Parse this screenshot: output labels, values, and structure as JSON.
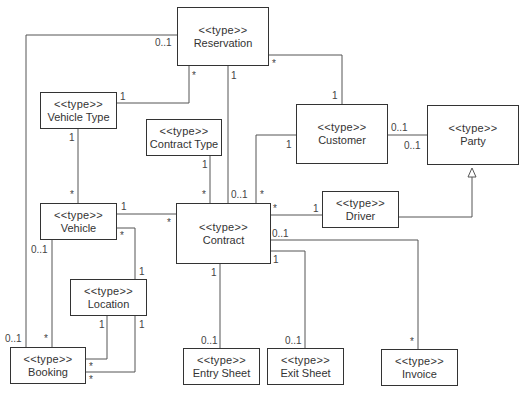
{
  "diagram": {
    "type": "uml-class-diagram",
    "stereotype": "<<type>>",
    "classes": [
      {
        "id": "reservation",
        "name": "Reservation"
      },
      {
        "id": "vehicle_type",
        "name": "Vehicle Type"
      },
      {
        "id": "contract_type",
        "name": "Contract Type"
      },
      {
        "id": "customer",
        "name": "Customer"
      },
      {
        "id": "party",
        "name": "Party"
      },
      {
        "id": "vehicle",
        "name": "Vehicle"
      },
      {
        "id": "contract",
        "name": "Contract"
      },
      {
        "id": "driver",
        "name": "Driver"
      },
      {
        "id": "location",
        "name": "Location"
      },
      {
        "id": "booking",
        "name": "Booking"
      },
      {
        "id": "entry_sheet",
        "name": "Entry Sheet"
      },
      {
        "id": "exit_sheet",
        "name": "Exit Sheet"
      },
      {
        "id": "invoice",
        "name": "Invoice"
      }
    ],
    "associations": [
      {
        "from": "Reservation",
        "to": "Vehicle Type",
        "from_mult": "*",
        "to_mult": "1"
      },
      {
        "from": "Reservation",
        "to": "Booking",
        "from_mult": "0..1",
        "to_mult": "0..1"
      },
      {
        "from": "Reservation",
        "to": "Contract",
        "from_mult": "1",
        "to_mult": "0..1"
      },
      {
        "from": "Reservation",
        "to": "Customer",
        "from_mult": "*",
        "to_mult": "1"
      },
      {
        "from": "Vehicle Type",
        "to": "Vehicle",
        "from_mult": "1",
        "to_mult": "*"
      },
      {
        "from": "Contract Type",
        "to": "Contract",
        "from_mult": "1",
        "to_mult": "*"
      },
      {
        "from": "Customer",
        "to": "Contract",
        "from_mult": "1",
        "to_mult": "*"
      },
      {
        "from": "Customer",
        "to": "Party",
        "from_mult": "0..1",
        "to_mult": "0..1"
      },
      {
        "from": "Vehicle",
        "to": "Contract",
        "from_mult": "1",
        "to_mult": "*"
      },
      {
        "from": "Vehicle",
        "to": "Location",
        "from_mult": "*",
        "to_mult": "1"
      },
      {
        "from": "Vehicle",
        "to": "Booking",
        "from_mult": "0..1",
        "to_mult": "*"
      },
      {
        "from": "Location",
        "to": "Booking",
        "from_mult": "1",
        "to_mult": "*"
      },
      {
        "from": "Location",
        "to": "Booking",
        "from_mult": "1",
        "to_mult": "*"
      },
      {
        "from": "Contract",
        "to": "Driver",
        "from_mult": "*",
        "to_mult": "1"
      },
      {
        "from": "Contract",
        "to": "Invoice",
        "from_mult": "0..1",
        "to_mult": "*"
      },
      {
        "from": "Contract",
        "to": "Exit Sheet",
        "from_mult": "1",
        "to_mult": "0..1"
      },
      {
        "from": "Contract",
        "to": "Entry Sheet",
        "from_mult": "1",
        "to_mult": "0..1"
      }
    ],
    "generalizations": [
      {
        "child": "Driver",
        "parent": "Party"
      }
    ],
    "labels": {
      "res_booking_res": "0..1",
      "res_vt_res": "*",
      "res_vt_vt": "1",
      "res_contract_res": "1",
      "res_contract_con": "0..1",
      "res_cust_res": "*",
      "res_cust_cust": "1",
      "vt_vehicle_vt": "1",
      "vt_vehicle_veh": "*",
      "ct_contract_ct": "1",
      "ct_contract_con": "*",
      "cust_contract_cust": "1",
      "cust_contract_con": "*",
      "cust_party_cust": "0..1",
      "cust_party_party": "0..1",
      "veh_contract_veh": "1",
      "veh_contract_con": "*",
      "veh_location_veh": "*",
      "veh_location_loc": "1",
      "veh_booking_veh": "0..1",
      "veh_booking_book": "*",
      "res_booking_book": "0..1",
      "loc_booking1_loc": "1",
      "loc_booking2_loc": "1",
      "loc_booking1_book": "*",
      "loc_booking2_book": "*",
      "con_driver_con": "*",
      "con_driver_drv": "1",
      "con_invoice_con": "0..1",
      "con_invoice_inv": "*",
      "con_exit_con": "1",
      "con_exit_exit": "0..1",
      "con_entry_con": "1",
      "con_entry_entry": "0..1"
    }
  }
}
